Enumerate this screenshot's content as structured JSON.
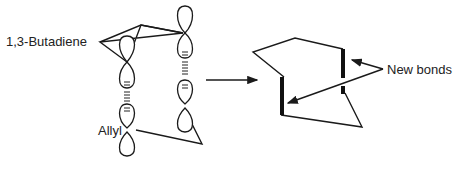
{
  "labels": {
    "butadiene": "1,3-Butadiene",
    "allyl": "Allyl",
    "new_bonds": "New bonds"
  },
  "colors": {
    "stroke": "#1a1a1a",
    "background": "#ffffff"
  }
}
